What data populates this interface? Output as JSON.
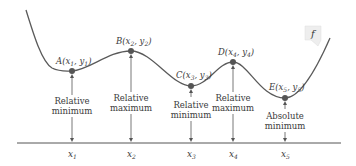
{
  "colors": {
    "curve": "#5a5a5a",
    "point": "#555555",
    "axis": "#555555",
    "text": "#3a3a3a",
    "label_box": "#eeeeee"
  },
  "function_label": "f",
  "points": [
    {
      "id": "A",
      "name": "A",
      "x_sub": "1",
      "y_sub": "1",
      "annotation": [
        "Relative",
        "minimum"
      ],
      "xtick": "x",
      "xtick_sub": "1"
    },
    {
      "id": "B",
      "name": "B",
      "x_sub": "2",
      "y_sub": "2",
      "annotation": [
        "Relative",
        "maximum"
      ],
      "xtick": "x",
      "xtick_sub": "2"
    },
    {
      "id": "C",
      "name": "C",
      "x_sub": "3",
      "y_sub": "3",
      "annotation": [
        "Relative",
        "minimum"
      ],
      "xtick": "x",
      "xtick_sub": "3"
    },
    {
      "id": "D",
      "name": "D",
      "x_sub": "4",
      "y_sub": "4",
      "annotation": [
        "Relative",
        "maximum"
      ],
      "xtick": "x",
      "xtick_sub": "4"
    },
    {
      "id": "E",
      "name": "E",
      "x_sub": "5",
      "y_sub": "5",
      "annotation": [
        "Absolute",
        "minimum"
      ],
      "xtick": "x",
      "xtick_sub": "5"
    }
  ]
}
